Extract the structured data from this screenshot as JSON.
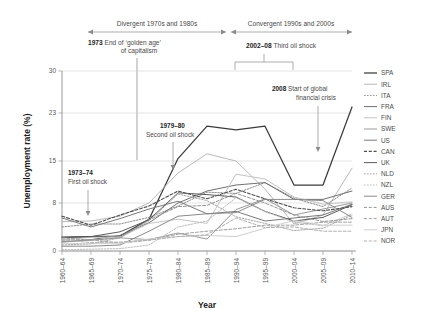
{
  "chart_data": {
    "type": "line",
    "title": "",
    "xlabel": "Year",
    "ylabel": "Unemployment rate (%)",
    "categories": [
      "1960–64",
      "1965–69",
      "1970–74",
      "1975–79",
      "1980–84",
      "1985–89",
      "1990–94",
      "1995–99",
      "2000–04",
      "2005–09",
      "2010–14"
    ],
    "yticks": [
      0,
      8,
      15,
      23,
      30
    ],
    "ylim": [
      0,
      30
    ],
    "grid": true,
    "legend_position": "right",
    "series": [
      {
        "name": "SPA",
        "color": "#3a3a3a",
        "width": 1.25,
        "dash": "none",
        "values": [
          2.3,
          2.4,
          2.5,
          5.3,
          15.4,
          20.8,
          20.2,
          20.8,
          11.0,
          11.0,
          24.0
        ]
      },
      {
        "name": "IRL",
        "color": "#b9b9b9",
        "width": 1.0,
        "dash": "none",
        "values": [
          4.9,
          5.0,
          5.8,
          8.0,
          13.0,
          16.2,
          15.0,
          10.3,
          4.5,
          6.0,
          13.8
        ]
      },
      {
        "name": "ITA",
        "color": "#8d8d8d",
        "width": 1.0,
        "dash": "dot",
        "values": [
          4.0,
          4.5,
          4.5,
          5.6,
          7.5,
          9.8,
          9.6,
          11.4,
          8.8,
          7.4,
          10.5
        ]
      },
      {
        "name": "FRA",
        "color": "#6f6f6f",
        "width": 1.0,
        "dash": "none",
        "values": [
          1.5,
          1.9,
          2.6,
          4.7,
          8.0,
          10.0,
          11.0,
          11.4,
          8.6,
          8.6,
          10.0
        ]
      },
      {
        "name": "FIN",
        "color": "#c4c4c4",
        "width": 1.0,
        "dash": "none",
        "values": [
          1.8,
          2.3,
          2.3,
          4.6,
          5.3,
          4.6,
          12.8,
          12.0,
          9.0,
          7.8,
          8.2
        ]
      },
      {
        "name": "SWE",
        "color": "#9a9a9a",
        "width": 1.0,
        "dash": "none",
        "values": [
          1.5,
          1.8,
          2.2,
          1.9,
          3.0,
          2.0,
          6.9,
          8.7,
          6.0,
          7.0,
          8.0
        ]
      },
      {
        "name": "US",
        "color": "#7a7a7a",
        "width": 1.0,
        "dash": "none",
        "values": [
          5.5,
          4.0,
          5.4,
          7.0,
          8.3,
          6.2,
          6.6,
          5.0,
          5.5,
          6.0,
          7.8
        ]
      },
      {
        "name": "CAN",
        "color": "#4c4c4c",
        "width": 1.1,
        "dash": "dash",
        "values": [
          5.8,
          4.3,
          6.0,
          7.5,
          10.0,
          8.7,
          10.3,
          8.7,
          7.2,
          6.7,
          7.4
        ]
      },
      {
        "name": "UK",
        "color": "#5c5c5c",
        "width": 1.0,
        "dash": "none",
        "values": [
          2.2,
          2.4,
          3.2,
          5.2,
          9.7,
          9.4,
          9.0,
          6.6,
          5.0,
          5.6,
          7.7
        ]
      },
      {
        "name": "NLD",
        "color": "#a8a8a8",
        "width": 1.0,
        "dash": "dot",
        "values": [
          1.0,
          1.2,
          2.2,
          5.0,
          9.5,
          8.4,
          5.7,
          4.6,
          3.4,
          3.8,
          6.0
        ]
      },
      {
        "name": "NZL",
        "color": "#bdbdbd",
        "width": 1.0,
        "dash": "dot",
        "values": [
          0.2,
          0.3,
          0.4,
          1.0,
          4.0,
          5.0,
          8.9,
          6.6,
          4.8,
          4.2,
          6.2
        ]
      },
      {
        "name": "GER",
        "color": "#8a8a8a",
        "width": 1.0,
        "dash": "none",
        "values": [
          0.8,
          0.8,
          1.0,
          3.3,
          5.8,
          6.2,
          6.4,
          8.6,
          8.6,
          8.4,
          5.6
        ]
      },
      {
        "name": "AUS",
        "color": "#959595",
        "width": 1.0,
        "dash": "dash",
        "values": [
          2.2,
          1.8,
          2.2,
          5.2,
          7.4,
          7.6,
          9.6,
          8.0,
          6.0,
          4.9,
          5.4
        ]
      },
      {
        "name": "AUT",
        "color": "#a0a0a0",
        "width": 1.0,
        "dash": "dash",
        "values": [
          1.8,
          1.9,
          1.3,
          1.8,
          2.8,
          3.3,
          3.7,
          4.3,
          4.3,
          4.8,
          4.8
        ]
      },
      {
        "name": "JPN",
        "color": "#cfcfcf",
        "width": 1.0,
        "dash": "none",
        "values": [
          1.3,
          1.2,
          1.3,
          2.0,
          2.4,
          2.6,
          2.4,
          3.8,
          5.1,
          4.3,
          4.3
        ]
      },
      {
        "name": "NOR",
        "color": "#b0b0b0",
        "width": 1.0,
        "dash": "dash",
        "values": [
          1.9,
          1.4,
          1.5,
          1.8,
          2.4,
          2.7,
          5.5,
          3.9,
          4.0,
          3.3,
          3.3
        ]
      }
    ],
    "annotations": [
      {
        "id": "divergent",
        "bold": "",
        "text": "Divergent 1970s and 1980s"
      },
      {
        "id": "convergent",
        "bold": "",
        "text": "Convergent 1990s and 2000s"
      },
      {
        "id": "golden-age",
        "bold": "1973",
        "line1": "End of ‘golden age’",
        "line2": "of capitalism"
      },
      {
        "id": "third-oil-shock",
        "bold": "2002–08",
        "line1": "Third oil shock"
      },
      {
        "id": "first-oil-shock",
        "bold": "1973–74",
        "line1": "First oil shock"
      },
      {
        "id": "second-oil-shock",
        "bold": "1979–80",
        "line1": "Second oil shock"
      },
      {
        "id": "financial-crisis",
        "bold": "2008",
        "line1": "Start of global",
        "line2": "financial crisis"
      }
    ]
  }
}
